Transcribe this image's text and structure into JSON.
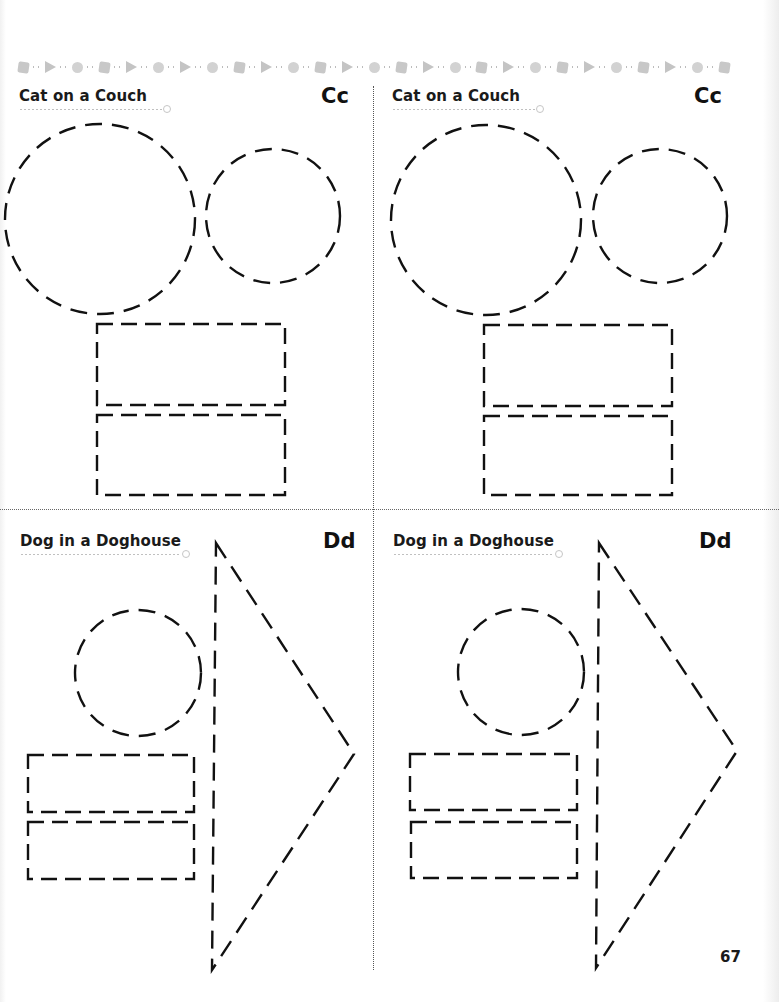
{
  "page": {
    "page_number": "67",
    "border_strip_icons": [
      "square",
      "triangle",
      "circle",
      "square",
      "triangle",
      "circle",
      "triangle",
      "circle",
      "square",
      "triangle",
      "circle",
      "square",
      "triangle",
      "circle",
      "square",
      "triangle",
      "circle",
      "square",
      "triangle",
      "circle",
      "square",
      "triangle",
      "circle",
      "square",
      "triangle",
      "circle",
      "square"
    ]
  },
  "panels": [
    {
      "id": "top-left",
      "title": "Cat on a Couch",
      "letters": "Cc",
      "shapes": [
        {
          "type": "circle",
          "cx": 100,
          "cy": 219,
          "r": 95
        },
        {
          "type": "circle",
          "cx": 273,
          "cy": 216,
          "r": 67
        },
        {
          "type": "rect",
          "x": 97,
          "y": 324,
          "w": 188,
          "h": 81
        },
        {
          "type": "rect",
          "x": 97,
          "y": 415,
          "w": 188,
          "h": 80
        }
      ]
    },
    {
      "id": "top-right",
      "title": "Cat on a Couch",
      "letters": "Cc",
      "shapes": [
        {
          "type": "circle",
          "cx": 486,
          "cy": 220,
          "r": 95
        },
        {
          "type": "circle",
          "cx": 660,
          "cy": 216,
          "r": 67
        },
        {
          "type": "rect",
          "x": 484,
          "y": 325,
          "w": 188,
          "h": 81
        },
        {
          "type": "rect",
          "x": 484,
          "y": 416,
          "w": 188,
          "h": 79
        }
      ]
    },
    {
      "id": "bottom-left",
      "title": "Dog in a Doghouse",
      "letters": "Dd",
      "shapes": [
        {
          "type": "circle",
          "cx": 138,
          "cy": 673,
          "r": 63
        },
        {
          "type": "rect",
          "x": 28,
          "y": 755,
          "w": 166,
          "h": 57
        },
        {
          "type": "rect",
          "x": 28,
          "y": 822,
          "w": 166,
          "h": 57
        },
        {
          "type": "triangle",
          "points": "216,543 354,754 212,970"
        }
      ]
    },
    {
      "id": "bottom-right",
      "title": "Dog in a Doghouse",
      "letters": "Dd",
      "shapes": [
        {
          "type": "circle",
          "cx": 521,
          "cy": 672,
          "r": 63
        },
        {
          "type": "rect",
          "x": 410,
          "y": 754,
          "w": 167,
          "h": 56
        },
        {
          "type": "rect",
          "x": 411,
          "y": 822,
          "w": 166,
          "h": 56
        },
        {
          "type": "triangle",
          "points": "599,543 737,751 596,968"
        }
      ]
    }
  ],
  "colors": {
    "stroke": "#111111",
    "divider": "#666666",
    "strip_gray": "#c8c8c8"
  }
}
